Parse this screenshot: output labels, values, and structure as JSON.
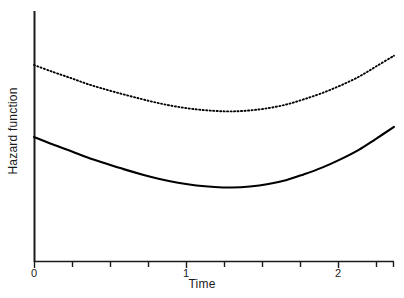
{
  "chart_data": {
    "type": "line",
    "title": "",
    "xlabel": "Time",
    "ylabel": "Hazard function",
    "xlim": [
      0,
      2.35
    ],
    "ylim": [
      0,
      1
    ],
    "grid": false,
    "legend": "none",
    "x_ticks": [
      0,
      0.25,
      0.5,
      0.75,
      1,
      1.25,
      1.5,
      1.75,
      2,
      2.25
    ],
    "x_tick_labels": [
      "0",
      "",
      "",
      "",
      "1",
      "",
      "",
      "",
      "2",
      ""
    ],
    "y_ticks": [],
    "y_tick_labels": [],
    "note": "Two proportional U-shaped (bathtub) hazard curves; y-axis is unlabeled/relative.",
    "series": [
      {
        "name": "baseline-hazard",
        "style": "solid",
        "color": "#000000",
        "x": [
          0.0,
          0.12,
          0.24,
          0.35,
          0.47,
          0.59,
          0.71,
          0.82,
          0.94,
          1.06,
          1.18,
          1.29,
          1.41,
          1.53,
          1.65,
          1.76,
          1.88,
          2.0,
          2.12,
          2.23,
          2.35
        ],
        "y": [
          0.498,
          0.469,
          0.442,
          0.416,
          0.392,
          0.369,
          0.348,
          0.331,
          0.316,
          0.305,
          0.299,
          0.297,
          0.301,
          0.311,
          0.327,
          0.349,
          0.376,
          0.409,
          0.447,
          0.49,
          0.538
        ]
      },
      {
        "name": "comparison-hazard",
        "style": "dotted",
        "color": "#000000",
        "x": [
          0.0,
          0.12,
          0.24,
          0.35,
          0.47,
          0.59,
          0.71,
          0.82,
          0.94,
          1.06,
          1.18,
          1.29,
          1.41,
          1.53,
          1.65,
          1.76,
          1.88,
          2.0,
          2.12,
          2.23,
          2.35
        ],
        "y": [
          0.785,
          0.758,
          0.733,
          0.709,
          0.687,
          0.667,
          0.648,
          0.632,
          0.618,
          0.608,
          0.602,
          0.6,
          0.604,
          0.613,
          0.628,
          0.648,
          0.673,
          0.703,
          0.738,
          0.778,
          0.822
        ]
      }
    ]
  },
  "axes": {
    "x_axis_name": "time-axis",
    "y_axis_name": "hazard-axis"
  }
}
